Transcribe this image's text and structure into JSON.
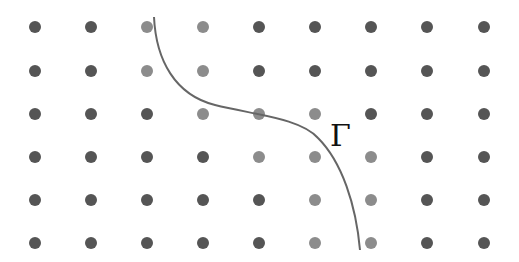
{
  "diagram": {
    "type": "lattice-with-curve",
    "grid": {
      "columns": 9,
      "rows": 6,
      "x_positions": [
        35,
        91,
        147,
        203,
        259,
        315,
        371,
        427,
        484
      ],
      "y_positions": [
        27,
        71,
        114,
        157,
        200,
        243
      ],
      "dot_radius": 6
    },
    "colors": {
      "background": "#ffffff",
      "dot_dark": "#555555",
      "dot_light": "#8c8c8c",
      "curve": "#666666",
      "label": "#111111"
    },
    "dot_states": [
      [
        "dark",
        "dark",
        "light",
        "light",
        "dark",
        "dark",
        "dark",
        "dark",
        "dark"
      ],
      [
        "dark",
        "dark",
        "light",
        "light",
        "dark",
        "dark",
        "dark",
        "dark",
        "dark"
      ],
      [
        "dark",
        "dark",
        "dark",
        "light",
        "light",
        "light",
        "dark",
        "dark",
        "dark"
      ],
      [
        "dark",
        "dark",
        "dark",
        "dark",
        "light",
        "light",
        "light",
        "dark",
        "dark"
      ],
      [
        "dark",
        "dark",
        "dark",
        "dark",
        "dark",
        "light",
        "light",
        "dark",
        "dark"
      ],
      [
        "dark",
        "dark",
        "dark",
        "dark",
        "dark",
        "light",
        "light",
        "dark",
        "dark"
      ]
    ],
    "curve": {
      "name": "Gamma",
      "path": "M 154 17 C 156 60, 175 95, 215 105 C 255 115, 300 118, 318 138 C 342 162, 356 205, 360 250"
    },
    "curve_label": {
      "text": "Γ",
      "x": 330,
      "y": 146,
      "font_size": 30
    }
  }
}
